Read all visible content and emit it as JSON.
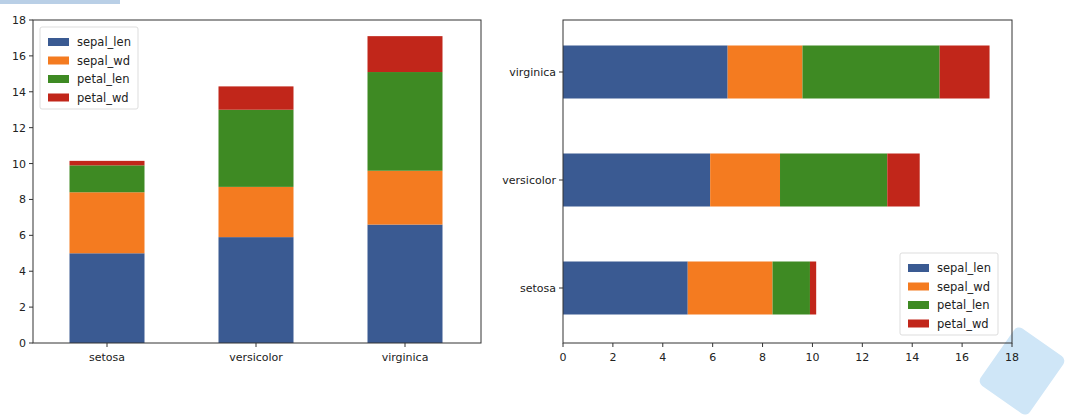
{
  "chart_data": [
    {
      "type": "bar",
      "orientation": "vertical",
      "stacked": true,
      "title": "",
      "xlabel": "",
      "ylabel": "",
      "categories": [
        "setosa",
        "versicolor",
        "virginica"
      ],
      "series": [
        {
          "name": "sepal_len",
          "color": "#3a5a92",
          "values": [
            5.0,
            5.9,
            6.6
          ]
        },
        {
          "name": "sepal_wd",
          "color": "#f47b20",
          "values": [
            3.4,
            2.8,
            3.0
          ]
        },
        {
          "name": "petal_len",
          "color": "#3e8a23",
          "values": [
            1.5,
            4.3,
            5.5
          ]
        },
        {
          "name": "petal_wd",
          "color": "#c1261a",
          "values": [
            0.25,
            1.3,
            2.0
          ]
        }
      ],
      "ylim": [
        0,
        18
      ],
      "yticks": [
        "0",
        "2",
        "4",
        "6",
        "8",
        "10",
        "12",
        "14",
        "16",
        "18"
      ],
      "grid": false,
      "legend_position": "upper left"
    },
    {
      "type": "bar",
      "orientation": "horizontal",
      "stacked": true,
      "title": "",
      "xlabel": "",
      "ylabel": "",
      "categories": [
        "setosa",
        "versicolor",
        "virginica"
      ],
      "series": [
        {
          "name": "sepal_len",
          "color": "#3a5a92",
          "values": [
            5.0,
            5.9,
            6.6
          ]
        },
        {
          "name": "sepal_wd",
          "color": "#f47b20",
          "values": [
            3.4,
            2.8,
            3.0
          ]
        },
        {
          "name": "petal_len",
          "color": "#3e8a23",
          "values": [
            1.5,
            4.3,
            5.5
          ]
        },
        {
          "name": "petal_wd",
          "color": "#c1261a",
          "values": [
            0.25,
            1.3,
            2.0
          ]
        }
      ],
      "xlim": [
        0,
        18
      ],
      "xticks": [
        "0",
        "2",
        "4",
        "6",
        "8",
        "10",
        "12",
        "14",
        "16",
        "18"
      ],
      "grid": false,
      "legend_position": "lower right"
    }
  ]
}
